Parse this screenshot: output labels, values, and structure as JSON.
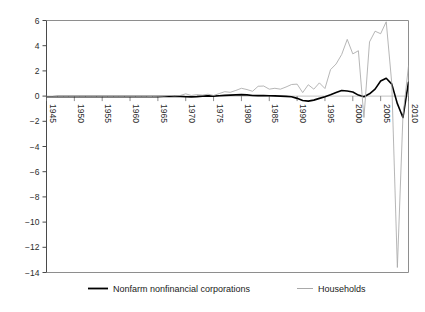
{
  "chart_data": {
    "type": "line",
    "title": "",
    "subtitle": "",
    "xlabel": "",
    "ylabel": "",
    "xlim": [
      1945,
      2010
    ],
    "ylim": [
      -14,
      6
    ],
    "grid": false,
    "legend_position": "bottom",
    "y_ticks": [
      6,
      4,
      2,
      0,
      -2,
      -4,
      -6,
      -8,
      -10,
      -12,
      -14
    ],
    "y_tick_labels": [
      "6",
      "4",
      "2",
      "0",
      "-2",
      "-4",
      "-6",
      "-8",
      "-10",
      "-12",
      "-14"
    ],
    "x_ticks": [
      1945,
      1950,
      1955,
      1960,
      1965,
      1970,
      1975,
      1980,
      1985,
      1990,
      1995,
      2000,
      2005,
      2010
    ],
    "x_tick_labels": [
      "1945",
      "1950",
      "1955",
      "1960",
      "1965",
      "1970",
      "1975",
      "1980",
      "1985",
      "1990",
      "1995",
      "2000",
      "2005",
      "2010"
    ],
    "x_tick_rotation": 90,
    "x": [
      1945,
      1946,
      1947,
      1948,
      1949,
      1950,
      1951,
      1952,
      1953,
      1954,
      1955,
      1956,
      1957,
      1958,
      1959,
      1960,
      1961,
      1962,
      1963,
      1964,
      1965,
      1966,
      1967,
      1968,
      1969,
      1970,
      1971,
      1972,
      1973,
      1974,
      1975,
      1976,
      1977,
      1978,
      1979,
      1980,
      1981,
      1982,
      1983,
      1984,
      1985,
      1986,
      1987,
      1988,
      1989,
      1990,
      1991,
      1992,
      1993,
      1994,
      1995,
      1996,
      1997,
      1998,
      1999,
      2000,
      2001,
      2002,
      2003,
      2004,
      2005,
      2006,
      2007,
      2008,
      2009,
      2010
    ],
    "series": [
      {
        "name": "Nonfarm nonfinancial corporations",
        "color": "#000000",
        "line_style": "solid",
        "line_width": "thick",
        "values": [
          -0.05,
          -0.05,
          -0.04,
          -0.04,
          -0.04,
          -0.04,
          -0.04,
          -0.04,
          -0.04,
          -0.04,
          -0.04,
          -0.04,
          -0.04,
          -0.04,
          -0.04,
          -0.04,
          -0.04,
          -0.04,
          -0.04,
          -0.04,
          -0.04,
          -0.03,
          -0.03,
          -0.02,
          -0.02,
          -0.05,
          -0.06,
          -0.04,
          0.0,
          0.02,
          0.0,
          0.03,
          0.06,
          0.08,
          0.1,
          0.12,
          0.1,
          0.05,
          0.04,
          0.04,
          0.03,
          0.02,
          0.0,
          -0.02,
          -0.05,
          -0.18,
          -0.35,
          -0.4,
          -0.32,
          -0.18,
          -0.05,
          0.1,
          0.28,
          0.45,
          0.4,
          0.32,
          0.08,
          -0.05,
          0.18,
          0.55,
          1.2,
          1.42,
          0.95,
          -0.6,
          -1.7,
          1.1
        ]
      },
      {
        "name": "Households",
        "color": "#a9a9a9",
        "line_style": "solid",
        "line_width": "thin",
        "values": [
          -0.05,
          -0.05,
          -0.04,
          -0.04,
          -0.04,
          -0.04,
          -0.04,
          -0.04,
          -0.04,
          -0.04,
          -0.04,
          -0.04,
          -0.04,
          -0.04,
          -0.04,
          -0.04,
          -0.04,
          -0.04,
          -0.04,
          -0.03,
          -0.02,
          0.0,
          0.05,
          0.02,
          0.05,
          0.18,
          0.05,
          0.12,
          0.08,
          0.15,
          0.05,
          0.2,
          0.35,
          0.3,
          0.45,
          0.62,
          0.52,
          0.38,
          0.78,
          0.8,
          0.55,
          0.62,
          0.55,
          0.72,
          0.92,
          0.95,
          0.28,
          0.9,
          0.55,
          1.05,
          0.6,
          2.1,
          2.55,
          3.3,
          4.5,
          3.35,
          3.6,
          -1.7,
          4.3,
          5.15,
          4.95,
          5.9,
          1.0,
          -13.6,
          -1.6,
          2.4
        ]
      }
    ]
  },
  "legend": {
    "items": [
      {
        "label": "Nonfarm nonfinancial corporations",
        "color": "#000000"
      },
      {
        "label": "Households",
        "color": "#a9a9a9"
      }
    ]
  }
}
